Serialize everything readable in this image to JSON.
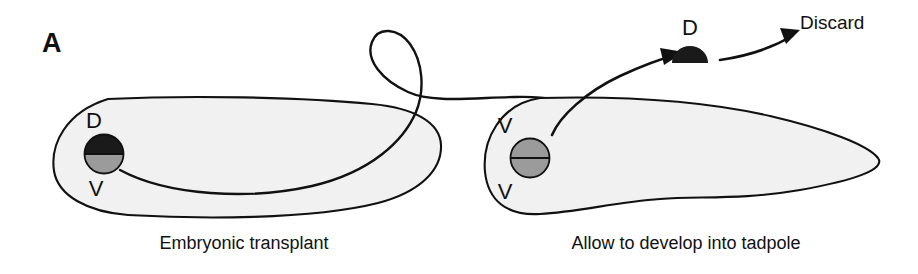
{
  "figure": {
    "panel_label": "A",
    "background_color": "#ffffff",
    "ink_color": "#111111",
    "embryo_fill_color": "#f1f1f1",
    "dorsal_fill_color": "#1a1a1a",
    "ventral_fill_color": "#9b9b9b"
  },
  "donor": {
    "caption": "Embryonic transplant",
    "dorsal_label": "D",
    "ventral_label": "V",
    "graft_name": "donor-graft-circle"
  },
  "host": {
    "caption": "Allow to develop into tadpole",
    "upper_label": "V",
    "lower_label": "V",
    "graft_name": "host-graft-circle"
  },
  "discarded": {
    "dorsal_label": "D",
    "discard_label": "Discard"
  },
  "annotations": {
    "transplant_arrow": "transplant-arrow",
    "removal_arrow": "removal-arrow",
    "discard_arrow": "discard-arrow"
  }
}
